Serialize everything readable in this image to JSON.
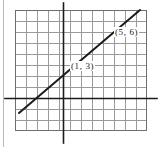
{
  "figure": {
    "background_color": "#ffffff",
    "width": 163,
    "height": 147
  },
  "grid": {
    "columns": 12,
    "rows": 11,
    "cell_size_px": 11,
    "left_px": 15,
    "top_px": 10,
    "width_px": 132,
    "height_px": 121,
    "line_color": "#9a9a9a",
    "border_color": "#6e6e6e",
    "visible": true
  },
  "axes": {
    "color": "#1b1b1b",
    "x_axis": {
      "name": "x-axis",
      "y_px": 98,
      "x_start_px": 5,
      "x_end_px": 157
    },
    "y_axis": {
      "name": "y-axis",
      "x_px": 63,
      "y_start_px": 3,
      "y_end_px": 143
    },
    "origin_px": {
      "x": 63,
      "y": 98
    }
  },
  "left_rule": {
    "color": "#b9b9b9",
    "x_px": 3
  },
  "chart_data": {
    "type": "line",
    "title": "",
    "xlabel": "",
    "ylabel": "",
    "grid": true,
    "legend": "none",
    "line_color": "#1b1b1b",
    "line_width_px": 2,
    "points": [
      {
        "label": "(1, 3)",
        "x": 1,
        "y": 3,
        "px": 74,
        "py": 65
      },
      {
        "label": "(5, 6)",
        "x": 5,
        "y": 6,
        "px": 118,
        "py": 32
      }
    ],
    "segment_px": {
      "x1": 19,
      "y1": 113,
      "x2": 140,
      "y2": 10
    },
    "slope": 0.75,
    "intercept": 2.25,
    "xlim": [
      -4,
      8
    ],
    "ylim": [
      -3,
      8
    ]
  },
  "labels": {
    "point_1": "(1, 3)",
    "point_2": "(5, 6)"
  }
}
